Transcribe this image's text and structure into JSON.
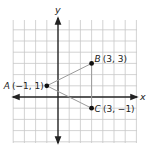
{
  "diagram": {
    "type": "coordinate-plane",
    "axes": {
      "x_label": "x",
      "y_label": "y"
    },
    "grid": {
      "x_min": -4,
      "x_max": 7,
      "y_min": -4,
      "y_max": 6,
      "show_grid": true
    },
    "points": [
      {
        "name": "A",
        "x": -1,
        "y": 1,
        "label": "A (−1, 1)",
        "label_name": "A",
        "label_coords": "(−1, 1)"
      },
      {
        "name": "B",
        "x": 3,
        "y": 3,
        "label": "B (3, 3)",
        "label_name": "B",
        "label_coords": "(3, 3)"
      },
      {
        "name": "C",
        "x": 3,
        "y": -1,
        "label": "C (3, −1)",
        "label_name": "C",
        "label_coords": "(3, −1)"
      }
    ],
    "segments": [
      {
        "from": "A",
        "to": "B"
      },
      {
        "from": "A",
        "to": "C"
      },
      {
        "from": "B",
        "to": "C"
      }
    ],
    "colors": {
      "grid": "#c8c8c8",
      "axis": "#222222",
      "segment": "#9a9a9a",
      "point": "#111111",
      "text": "#222222"
    }
  }
}
